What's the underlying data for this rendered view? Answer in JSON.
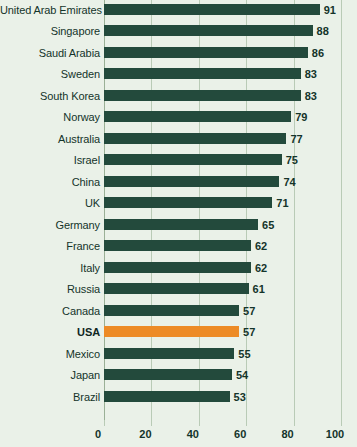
{
  "chart_data": {
    "type": "bar",
    "orientation": "horizontal",
    "title": "",
    "subtitle": "",
    "xlabel": "",
    "ylabel": "",
    "xlim": [
      0,
      100
    ],
    "xticks": [
      0,
      20,
      40,
      60,
      80,
      100
    ],
    "xtick_labels": [
      "0",
      "20",
      "40",
      "60",
      "80",
      "100"
    ],
    "grid": "vertical",
    "legend": "none",
    "categories": [
      "United Arab Emirates",
      "Singapore",
      "Saudi Arabia",
      "Sweden",
      "South Korea",
      "Norway",
      "Australia",
      "Israel",
      "China",
      "UK",
      "Germany",
      "France",
      "Italy",
      "Russia",
      "Canada",
      "USA",
      "Mexico",
      "Japan",
      "Brazil"
    ],
    "values": [
      91,
      88,
      86,
      83,
      83,
      79,
      77,
      75,
      74,
      71,
      65,
      62,
      62,
      61,
      57,
      57,
      55,
      54,
      53
    ],
    "value_labels": [
      "91",
      "88",
      "86",
      "83",
      "83",
      "79",
      "77",
      "75",
      "74",
      "71",
      "65",
      "62",
      "62",
      "61",
      "57",
      "57",
      "55",
      "54",
      "53"
    ],
    "highlight_category": "USA",
    "highlight_index": 15,
    "colors": {
      "background": "#eaf1e8",
      "bar": "#234a3c",
      "bar_highlight": "#ed8b26",
      "gridline": "#b9cbb6",
      "text": "#14342a"
    }
  }
}
